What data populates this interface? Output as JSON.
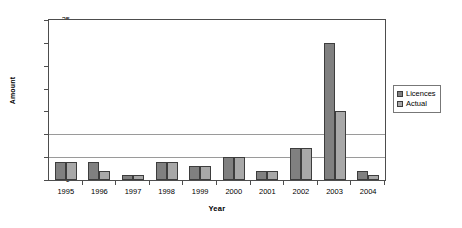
{
  "chart_data": {
    "type": "bar",
    "title": "",
    "xlabel": "Year",
    "ylabel": "Amount",
    "categories": [
      "1995",
      "1996",
      "1997",
      "1998",
      "1999",
      "2000",
      "2001",
      "2002",
      "2003",
      "2004"
    ],
    "series": [
      {
        "name": "Licences",
        "color": "#808080",
        "values": [
          4,
          4,
          1,
          4,
          3,
          5,
          2,
          7,
          30,
          2
        ]
      },
      {
        "name": "Actual",
        "color": "#a8a8a8",
        "values": [
          4,
          2,
          1,
          4,
          3,
          5,
          2,
          7,
          15,
          1
        ]
      }
    ],
    "ylim": [
      0,
      35
    ],
    "yticks": [
      0,
      5,
      10,
      15,
      20,
      25,
      30,
      35
    ],
    "ytick_labels": [
      "0",
      "5",
      "10",
      "15",
      "20",
      "25",
      "30",
      "35"
    ],
    "gridlines_at": [
      5,
      10
    ],
    "grid": true,
    "legend_position": "right",
    "legend_entries": [
      "Licences",
      "Actual"
    ]
  }
}
